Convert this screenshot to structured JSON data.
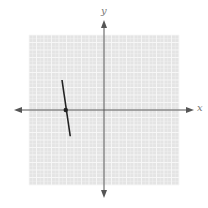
{
  "chart_data": {
    "type": "line",
    "title": "",
    "xlabel": "x",
    "ylabel": "y",
    "xlim": [
      -10,
      10
    ],
    "ylim": [
      -10,
      10
    ],
    "grid": true,
    "tick_labels_shown": false,
    "series": [
      {
        "name": "segment",
        "x": [
          -5.6,
          -4.5
        ],
        "y": [
          4.0,
          -3.5
        ],
        "color": "#222222"
      }
    ],
    "marked_points": [
      {
        "x": -5.1,
        "y": 0,
        "note": "x-intercept marker"
      }
    ]
  },
  "axes": {
    "x_label": "x",
    "y_label": "y"
  },
  "colors": {
    "grid_background": "#e4e4e4",
    "grid_lines": "#f7f7f7",
    "axis": "#555555",
    "line": "#222222"
  }
}
